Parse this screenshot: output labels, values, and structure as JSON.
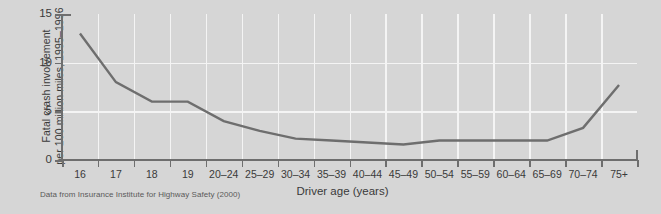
{
  "chart_data": {
    "type": "line",
    "title": "",
    "xlabel": "Driver age (years)",
    "ylabel_line1": "Fatal crash involvement",
    "ylabel_line2": "per 100 million miles, 1995–1996",
    "categories": [
      "16",
      "17",
      "18",
      "19",
      "20–24",
      "25–29",
      "30–34",
      "35–39",
      "40–44",
      "45–49",
      "50–54",
      "55–59",
      "60–64",
      "65–69",
      "70–74",
      "75+"
    ],
    "values": [
      13.0,
      8.0,
      6.0,
      6.0,
      4.0,
      3.0,
      2.2,
      2.0,
      1.8,
      1.6,
      2.0,
      2.0,
      2.0,
      2.0,
      3.3,
      7.7
    ],
    "ytick_labels": [
      "0",
      "5",
      "10",
      "15"
    ],
    "ytick_values": [
      0,
      5,
      10,
      15
    ],
    "ylim": [
      0,
      15
    ],
    "grid": "both",
    "legend": "none",
    "line_color": "#6e6e6e",
    "grid_color": "#f4f4f4",
    "background_color": "#d6d6d6",
    "caption": "Data from Insurance Institute for Highway Safety (2000)"
  },
  "figure": {
    "caption": "Data from Insurance Institute for Highway Safety (2000)"
  }
}
